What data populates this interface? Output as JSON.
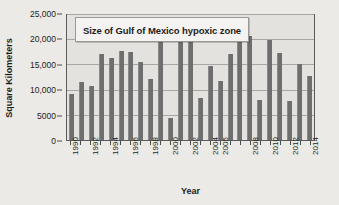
{
  "chart_data": {
    "type": "bar",
    "title": "Size of Gulf of Mexico hypoxic zone",
    "xlabel": "Year",
    "ylabel": "Square Kilometers",
    "ylim": [
      0,
      25000
    ],
    "grid": true,
    "legend": "none",
    "categories": [
      "1990",
      "1991",
      "1992",
      "1993",
      "1994",
      "1995",
      "1996",
      "1997",
      "1998",
      "1999",
      "2000",
      "2001",
      "2002",
      "2003",
      "2004",
      "2005",
      "2006",
      "2007",
      "2008",
      "2009",
      "2010",
      "2011",
      "2012",
      "2013",
      "2014"
    ],
    "values": [
      9200,
      11700,
      10800,
      17400,
      16500,
      18000,
      17800,
      15800,
      12300,
      19900,
      4400,
      20700,
      22000,
      8500,
      15000,
      11800,
      17300,
      20500,
      21000,
      8000,
      20100,
      17600,
      7900,
      15300,
      13000
    ],
    "y_ticks": [
      {
        "value": 0,
        "label": "0"
      },
      {
        "value": 5000,
        "label": "5000"
      },
      {
        "value": 10000,
        "label": "10,000"
      },
      {
        "value": 15000,
        "label": "15,000"
      },
      {
        "value": 20000,
        "label": "20,000"
      },
      {
        "value": 25000,
        "label": "25,000"
      }
    ],
    "x_tick_labels": [
      "1990",
      "",
      "1992",
      "",
      "1994",
      "",
      "1996",
      "",
      "1998",
      "",
      "2000",
      "",
      "2002",
      "",
      "2004",
      "2005",
      "",
      "",
      "2008",
      "",
      "2010",
      "",
      "2012",
      "",
      "2014"
    ],
    "bar_color": "#6e6e6e",
    "plot_background": "#e4e2de",
    "page_background": "#eceae6",
    "axis_color": "#5b5b5b",
    "grid_color": "#a8a6a2"
  }
}
